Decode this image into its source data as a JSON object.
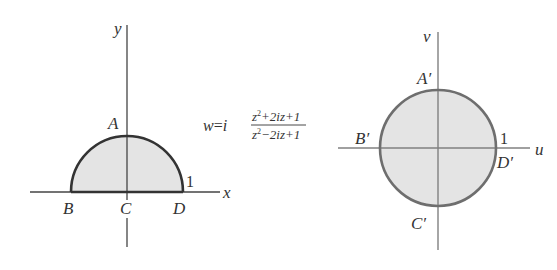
{
  "figure": {
    "colors": {
      "fill": "#e4e4e4",
      "left_curve": "#333333",
      "right_curve": "#6e6e6e",
      "axes": "#444444",
      "right_axes": "#808080",
      "text": "#333333"
    },
    "z_plane": {
      "axis_x_label": "x",
      "axis_y_label": "y",
      "region": "upper half of unit disk",
      "points": {
        "A": "A",
        "B": "B",
        "C": "C",
        "D": "D"
      },
      "radius_label": "1"
    },
    "mapping": {
      "lhs": "w",
      "eq": "=",
      "factor": "i",
      "numerator_z": "z",
      "numerator_exp": "2",
      "numerator_rest": "+2iz+1",
      "denominator_z": "z",
      "denominator_exp": "2",
      "denominator_rest": "−2iz+1"
    },
    "w_plane": {
      "axis_u_label": "u",
      "axis_v_label": "v",
      "region": "unit disk",
      "points": {
        "A_prime": "A′",
        "B_prime": "B′",
        "C_prime": "C′",
        "D_prime": "D′"
      },
      "radius_label": "1"
    }
  }
}
